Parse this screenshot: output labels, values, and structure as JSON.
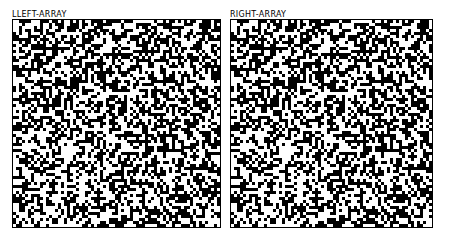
{
  "panels": [
    {
      "title": "LLEFT-ARRAY",
      "cols": 69,
      "rows": 69,
      "cell_px": 3,
      "seed": 1337
    },
    {
      "title": "RIGHT-ARRAY",
      "cols": 67,
      "rows": 69,
      "cell_px": 3,
      "seed": 1337
    }
  ],
  "colors": {
    "on": "#000000",
    "off": "#ffffff",
    "border": "#000000"
  },
  "density": 0.5
}
